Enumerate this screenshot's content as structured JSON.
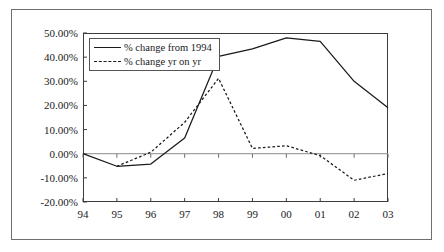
{
  "chart_data": {
    "type": "line",
    "title": "",
    "subtitle": "",
    "xlabel": "",
    "ylabel": "",
    "categories": [
      "94",
      "95",
      "96",
      "97",
      "98",
      "99",
      "00",
      "01",
      "02",
      "03"
    ],
    "ylim": [
      -20,
      50
    ],
    "yticks": [
      50,
      40,
      30,
      20,
      10,
      0,
      -10,
      -20
    ],
    "ytick_labels": [
      "50.00%",
      "40.00%",
      "30.00%",
      "20.00%",
      "10.00%",
      "0.00%",
      "-10.00%",
      "-20.00%"
    ],
    "grid": false,
    "legend_position": "upper-left-inside",
    "zero_line": true,
    "series": [
      {
        "name": "% change from 1994",
        "style": "solid",
        "color": "#1a1a1a",
        "values": [
          0.0,
          -5.2,
          -4.3,
          6.5,
          40.3,
          43.4,
          48.0,
          46.5,
          30.0,
          19.0
        ]
      },
      {
        "name": "% change yr on yr",
        "style": "dashed",
        "color": "#1a1a1a",
        "values": [
          null,
          -5.2,
          0.6,
          13.0,
          31.2,
          2.2,
          3.3,
          -0.8,
          -11.0,
          -8.2
        ]
      }
    ],
    "annotations": []
  },
  "legend": {
    "entries": [
      {
        "label": "% change from 1994",
        "style": "solid"
      },
      {
        "label": "% change yr on yr",
        "style": "dashed"
      }
    ]
  },
  "axis": {
    "y_labels": [
      "50.00%",
      "40.00%",
      "30.00%",
      "20.00%",
      "10.00%",
      "0.00%",
      "-10.00%",
      "-20.00%"
    ],
    "x_labels": [
      "94",
      "95",
      "96",
      "97",
      "98",
      "99",
      "00",
      "01",
      "02",
      "03"
    ]
  },
  "colors": {
    "line": "#1a1a1a",
    "axis": "#3c3c3c",
    "zero_line": "#8a8a8a",
    "frame": "#6f6f6f",
    "background": "#ffffff"
  }
}
